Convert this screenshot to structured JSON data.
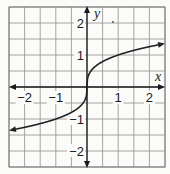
{
  "chart_data": {
    "type": "line",
    "title": "",
    "xlabel": "x",
    "ylabel": "y",
    "xlim": [
      -2.5,
      2.5
    ],
    "ylim": [
      -2.5,
      2.5
    ],
    "grid": true,
    "grid_step": 0.5,
    "x_ticks": [
      {
        "value": -2,
        "label": "−2"
      },
      {
        "value": -1,
        "label": "−1"
      },
      {
        "value": 1,
        "label": "1"
      },
      {
        "value": 2,
        "label": "2"
      }
    ],
    "y_ticks": [
      {
        "value": 2,
        "label": "2"
      },
      {
        "value": 1,
        "label": "1"
      },
      {
        "value": -1,
        "label": "−1"
      },
      {
        "value": -2,
        "label": "−2"
      }
    ],
    "series": [
      {
        "name": "y = cube root of x",
        "function": "y = x^(1/3)",
        "arrows_both_ends": true,
        "x": [
          -2.5,
          -2,
          -1.5,
          -1,
          -0.5,
          -0.25,
          -0.1,
          -0.02,
          0,
          0.02,
          0.1,
          0.25,
          0.5,
          1,
          1.5,
          2,
          2.5
        ],
        "y": [
          -1.36,
          -1.26,
          -1.14,
          -1.0,
          -0.79,
          -0.63,
          -0.46,
          -0.27,
          0,
          0.27,
          0.46,
          0.63,
          0.79,
          1.0,
          1.14,
          1.26,
          1.36
        ]
      }
    ],
    "legend": null,
    "colors": {
      "curve": "#222222",
      "axis": "#1a1a1a",
      "grid": "#9a9a9a"
    }
  }
}
